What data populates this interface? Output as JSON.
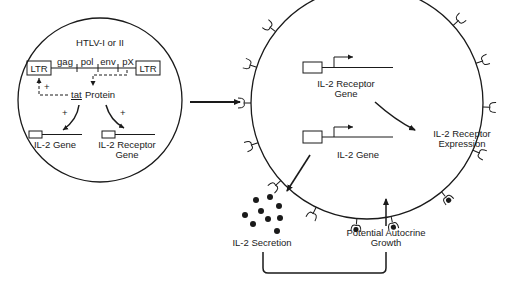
{
  "left_panel": {
    "title": "HTLV-I or II",
    "ltr_left": "LTR",
    "ltr_right": "LTR",
    "genes": [
      "gag",
      "pol",
      "env",
      "pX"
    ],
    "tat": "tat",
    "protein": "Protein",
    "plus_1": "+",
    "plus_2": "+",
    "plus_3": "+",
    "il2_gene": "IL-2 Gene",
    "il2_receptor_gene_line1": "IL-2 Receptor",
    "il2_receptor_gene_line2": "Gene"
  },
  "cell": {
    "il2_receptor_gene_line1": "IL-2 Receptor",
    "il2_receptor_gene_line2": "Gene",
    "il2_gene": "IL-2 Gene"
  },
  "outputs": {
    "receptor_expression_line1": "IL-2 Receptor",
    "receptor_expression_line2": "Expression",
    "secretion": "IL-2 Secretion",
    "autocrine_line1": "Potential Autocrine",
    "autocrine_line2": "Growth"
  },
  "colors": {
    "ink": "#1a1a1a",
    "background": "#ffffff"
  }
}
